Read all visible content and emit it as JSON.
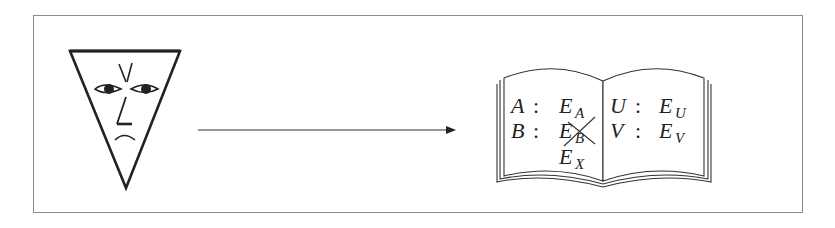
{
  "diagram": {
    "colors": {
      "ink": "#222222",
      "frame": "#8a8a8a",
      "background": "#ffffff"
    },
    "face": {
      "shape": "inverted-triangle",
      "expression": "frowning"
    },
    "arrow": {
      "direction": "right"
    },
    "book": {
      "left_page": [
        {
          "key": "A",
          "sep": ":",
          "value": "E",
          "sub": "A",
          "crossed": false
        },
        {
          "key": "B",
          "sep": ":",
          "value": "E",
          "sub": "B",
          "crossed": true
        },
        {
          "key": "",
          "sep": "",
          "value": "E",
          "sub": "X",
          "crossed": false
        }
      ],
      "right_page": [
        {
          "key": "U",
          "sep": ":",
          "value": "E",
          "sub": "U",
          "crossed": false
        },
        {
          "key": "V",
          "sep": ":",
          "value": "E",
          "sub": "V",
          "crossed": false
        }
      ]
    }
  }
}
